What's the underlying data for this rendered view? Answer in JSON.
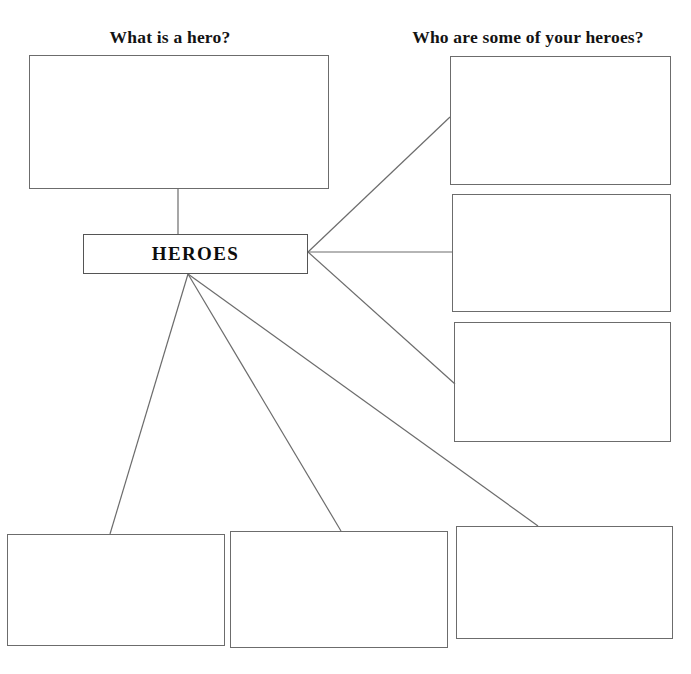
{
  "worksheet": {
    "width": 691,
    "height": 674,
    "background_color": "#ffffff",
    "line_color": "#6c6c6c",
    "text_color": "#131313"
  },
  "headings": [
    {
      "id": "what-is-a-hero",
      "text": "What is a hero?",
      "x": 85,
      "y": 27,
      "width": 170
    },
    {
      "id": "who-are-your-heroes",
      "text": "Who are some of your heroes?",
      "x": 395,
      "y": 27,
      "width": 266
    }
  ],
  "center_node": {
    "label": "HEROES",
    "x": 83,
    "y": 234,
    "width": 225,
    "height": 40
  },
  "boxes": [
    {
      "id": "definition-box",
      "group": "definition",
      "value": "",
      "x": 29,
      "y": 55,
      "width": 300,
      "height": 134
    },
    {
      "id": "hero-box-1",
      "group": "heroes",
      "value": "",
      "x": 450,
      "y": 56,
      "width": 221,
      "height": 129
    },
    {
      "id": "hero-box-2",
      "group": "heroes",
      "value": "",
      "x": 452,
      "y": 194,
      "width": 219,
      "height": 118
    },
    {
      "id": "hero-box-3",
      "group": "heroes",
      "value": "",
      "x": 454,
      "y": 322,
      "width": 217,
      "height": 120
    },
    {
      "id": "trait-box-1",
      "group": "traits",
      "value": "",
      "x": 7,
      "y": 534,
      "width": 218,
      "height": 112
    },
    {
      "id": "trait-box-2",
      "group": "traits",
      "value": "",
      "x": 230,
      "y": 531,
      "width": 218,
      "height": 117
    },
    {
      "id": "trait-box-3",
      "group": "traits",
      "value": "",
      "x": 456,
      "y": 526,
      "width": 217,
      "height": 113
    }
  ],
  "connectors": [
    {
      "id": "center-to-definition",
      "x1": 178,
      "y1": 234,
      "x2": 178,
      "y2": 189
    },
    {
      "id": "center-to-hero-1",
      "x1": 308,
      "y1": 252,
      "x2": 450,
      "y2": 117
    },
    {
      "id": "center-to-hero-2",
      "x1": 308,
      "y1": 252,
      "x2": 452,
      "y2": 252
    },
    {
      "id": "center-to-hero-3",
      "x1": 308,
      "y1": 252,
      "x2": 455,
      "y2": 384
    },
    {
      "id": "center-to-trait-1",
      "x1": 188,
      "y1": 274,
      "x2": 110,
      "y2": 534
    },
    {
      "id": "center-to-trait-2",
      "x1": 188,
      "y1": 274,
      "x2": 341,
      "y2": 531
    },
    {
      "id": "center-to-trait-3",
      "x1": 188,
      "y1": 274,
      "x2": 538,
      "y2": 526
    }
  ]
}
